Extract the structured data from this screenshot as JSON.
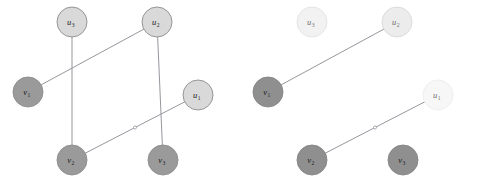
{
  "figure": {
    "type": "graph-diagram",
    "width": 480,
    "height": 188,
    "background": "#ffffff"
  },
  "style": {
    "node_radius": 15,
    "node_stroke": "#8c8c8c",
    "node_stroke_width": 0.9,
    "edge_color": "#8a8a92",
    "edge_width": 0.9,
    "colors": {
      "u_light": "#d9d9d9",
      "u_pale": "#f2f2f2",
      "u_faint": "#fafafa",
      "v_dark": "#9a9a9a",
      "v_darker": "#8f8f8f",
      "label_dark": "#1b1b1b",
      "label_faded": "#6f6f6f"
    }
  },
  "panels": [
    {
      "id": "left-panel",
      "name": "original-graph",
      "origin_x": 0,
      "nodes": [
        {
          "id": "u3",
          "label": "u",
          "sub": "3",
          "x": 72,
          "y": 22,
          "fill": "#d9d9d9",
          "stroke": "#8c8c8c",
          "label_class": ""
        },
        {
          "id": "u2",
          "label": "u",
          "sub": "2",
          "x": 157,
          "y": 22,
          "fill": "#d9d9d9",
          "stroke": "#8c8c8c",
          "label_class": ""
        },
        {
          "id": "v1",
          "label": "v",
          "sub": "1",
          "x": 28,
          "y": 92,
          "fill": "#9a9a9a",
          "stroke": "#8c8c8c",
          "label_class": ""
        },
        {
          "id": "u1",
          "label": "u",
          "sub": "1",
          "x": 198,
          "y": 95,
          "fill": "#d9d9d9",
          "stroke": "#8c8c8c",
          "label_class": ""
        },
        {
          "id": "v2",
          "label": "v",
          "sub": "2",
          "x": 72,
          "y": 160,
          "fill": "#9a9a9a",
          "stroke": "#8c8c8c",
          "label_class": ""
        },
        {
          "id": "v3",
          "label": "v",
          "sub": "3",
          "x": 163,
          "y": 160,
          "fill": "#9a9a9a",
          "stroke": "#8c8c8c",
          "label_class": ""
        }
      ],
      "edges": [
        {
          "id": "e-u3-v2",
          "from": "u3",
          "to": "v2",
          "kind": "vertical",
          "marker": false
        },
        {
          "id": "e-u2-v3",
          "from": "u2",
          "to": "v3",
          "kind": "vertical",
          "marker": false
        },
        {
          "id": "e-v1-u2",
          "from": "v1",
          "to": "u2",
          "kind": "diagonal",
          "marker": false
        },
        {
          "id": "e-v2-u1",
          "from": "v2",
          "to": "u1",
          "kind": "diagonal",
          "marker": true
        }
      ]
    },
    {
      "id": "right-panel",
      "name": "matching-subgraph",
      "origin_x": 240,
      "nodes": [
        {
          "id": "u3",
          "label": "u",
          "sub": "3",
          "x": 312,
          "y": 22,
          "fill": "#f2f2f2",
          "stroke": "#e2e2e2",
          "label_class": "faded"
        },
        {
          "id": "u2",
          "label": "u",
          "sub": "2",
          "x": 397,
          "y": 22,
          "fill": "#ececec",
          "stroke": "#d8d8d8",
          "label_class": "faded"
        },
        {
          "id": "v1",
          "label": "v",
          "sub": "1",
          "x": 268,
          "y": 92,
          "fill": "#8f8f8f",
          "stroke": "#858585",
          "label_class": ""
        },
        {
          "id": "u1",
          "label": "u",
          "sub": "1",
          "x": 438,
          "y": 95,
          "fill": "#f7f7f7",
          "stroke": "#ededed",
          "label_class": "faded"
        },
        {
          "id": "v2",
          "label": "v",
          "sub": "2",
          "x": 312,
          "y": 160,
          "fill": "#8f8f8f",
          "stroke": "#858585",
          "label_class": ""
        },
        {
          "id": "v3",
          "label": "v",
          "sub": "3",
          "x": 403,
          "y": 160,
          "fill": "#8f8f8f",
          "stroke": "#858585",
          "label_class": ""
        }
      ],
      "edges": [
        {
          "id": "e-v1-u2",
          "from": "v1",
          "to": "u2",
          "kind": "diagonal",
          "marker": false
        },
        {
          "id": "e-v2-u1",
          "from": "v2",
          "to": "u1",
          "kind": "diagonal",
          "marker": true
        }
      ]
    }
  ]
}
